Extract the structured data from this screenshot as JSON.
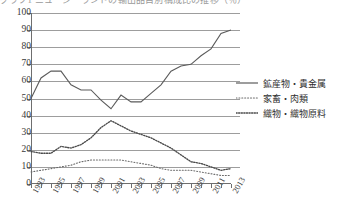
{
  "top_caption": "グラフ1 ニュージーランドの輸出品目別構成比の推移（％）",
  "axes": {
    "y_ticks": [
      0,
      10,
      20,
      30,
      40,
      50,
      60,
      70,
      80,
      90,
      100
    ],
    "y_min": 0,
    "y_max": 100,
    "x_labels": [
      "1993",
      "1995",
      "1997",
      "1999",
      "2001",
      "2003",
      "2005",
      "2007",
      "2009",
      "2011",
      "2013"
    ],
    "x_min": 1993,
    "x_max": 2013
  },
  "legend": {
    "items": [
      {
        "label": "鉱産物・貴金属",
        "style": "solid"
      },
      {
        "label": "家畜・肉類",
        "style": "dotted-fine"
      },
      {
        "label": "織物・織物原料",
        "style": "dotted-bold"
      }
    ]
  },
  "chart_data": {
    "type": "line",
    "title": "",
    "xlabel": "",
    "ylabel": "",
    "xlim": [
      1993,
      2013
    ],
    "ylim": [
      0,
      100
    ],
    "grid": true,
    "legend_position": "right",
    "x": [
      1993,
      1994,
      1995,
      1996,
      1997,
      1998,
      1999,
      2000,
      2001,
      2002,
      2003,
      2004,
      2005,
      2006,
      2007,
      2008,
      2009,
      2010,
      2011,
      2012,
      2013
    ],
    "series": [
      {
        "name": "鉱産物・貴金属",
        "style": "solid",
        "color": "#5b5b5b",
        "values": [
          50,
          62,
          66,
          66,
          58,
          55,
          55,
          49,
          44,
          52,
          48,
          48,
          53,
          58,
          66,
          69,
          70,
          75,
          79,
          88,
          90
        ]
      },
      {
        "name": "家畜・肉類",
        "style": "dotted-fine",
        "color": "#6a6a6a",
        "values": [
          7,
          8,
          9,
          10,
          11,
          13,
          14,
          14,
          14,
          14,
          13,
          12,
          11,
          9,
          8,
          8,
          8,
          7,
          6,
          5,
          5
        ]
      },
      {
        "name": "織物・織物原料",
        "style": "dotted-bold",
        "color": "#4a4a4a",
        "values": [
          19,
          18,
          18,
          22,
          21,
          23,
          27,
          33,
          37,
          34,
          31,
          29,
          27,
          24,
          21,
          17,
          13,
          12,
          10,
          8,
          9
        ]
      }
    ]
  }
}
